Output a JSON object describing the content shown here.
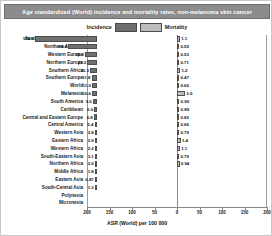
{
  "title": "Age standardized (World) incidence and mortality rates, non-melanoma skin cancer",
  "legend": {
    "incidence_label": "Incidence",
    "mortality_label": "Mortality",
    "incidence_color": "#6f6f6f",
    "mortality_color": "#bdbdbd"
  },
  "axis": {
    "xlabel": "ASR (World) per 100 000",
    "ticks": [
      "200",
      "150",
      "100",
      "50",
      "0",
      "50",
      "100",
      "150",
      "200"
    ]
  },
  "chart_data": {
    "type": "bar",
    "title": "Age standardized (World) incidence and mortality rates, non-melanoma skin cancer",
    "subtype": "diverging-horizontal-bar",
    "xlabel": "ASR (World) per 100 000",
    "ylabel": "",
    "xlim": [
      -200,
      200
    ],
    "xticks": [
      200,
      150,
      100,
      50,
      0,
      50,
      100,
      150,
      200
    ],
    "grid": false,
    "legend_position": "top-center",
    "categories": [
      "Australia and New Zealand",
      "Northern America",
      "Western Europe",
      "Northern Europe",
      "Southern Africa",
      "Southern Europe",
      "World",
      "Melanesia",
      "South America",
      "Caribbean",
      "Central and Eastern Europe",
      "Central America",
      "Western Asia",
      "Eastern Africa",
      "Western Africa",
      "South-Eastern Asia",
      "Northern Africa",
      "Middle Africa",
      "Eastern Asia",
      "South-Central Asia",
      "Polynesia",
      "Micronesia"
    ],
    "series": [
      {
        "name": "Incidence",
        "direction": "left",
        "color": "#6f6f6f",
        "values": [
          138.0,
          64.4,
          26.1,
          21.2,
          15.3,
          11.8,
          11.0,
          10.6,
          9.0,
          6.0,
          6.8,
          5.4,
          3.8,
          2.9,
          2.2,
          3.1,
          2.0,
          1.8,
          0.87,
          1.3,
          0.0,
          0.0
        ]
      },
      {
        "name": "Mortality",
        "direction": "right",
        "color": "#bdbdbd",
        "values": [
          1.1,
          0.59,
          0.53,
          0.71,
          1.2,
          0.47,
          0.6,
          3.0,
          0.9,
          0.89,
          0.82,
          0.66,
          0.79,
          1.4,
          1.1,
          0.79,
          0.94,
          0.0,
          0.0,
          0.0,
          0.0,
          0.0
        ]
      }
    ]
  },
  "rows": [
    {
      "label": "Australia and New Zealand",
      "incidence": "138.0",
      "mortality": "1.1",
      "inc_val": 138.0,
      "mor_val": 1.1
    },
    {
      "label": "Northern America",
      "incidence": "64.4",
      "mortality": "0.59",
      "inc_val": 64.4,
      "mor_val": 0.59
    },
    {
      "label": "Western Europe",
      "incidence": "26.1",
      "mortality": "0.53",
      "inc_val": 26.1,
      "mor_val": 0.53
    },
    {
      "label": "Northern Europe",
      "incidence": "21.2",
      "mortality": "0.71",
      "inc_val": 21.2,
      "mor_val": 0.71
    },
    {
      "label": "Southern Africa",
      "incidence": "15.3",
      "mortality": "1.2",
      "inc_val": 15.3,
      "mor_val": 1.2
    },
    {
      "label": "Southern Europe",
      "incidence": "11.8",
      "mortality": "0.47",
      "inc_val": 11.8,
      "mor_val": 0.47
    },
    {
      "label": "World",
      "incidence": "11.0",
      "mortality": "0.60",
      "inc_val": 11.0,
      "mor_val": 0.6
    },
    {
      "label": "Melanesia",
      "incidence": "10.6",
      "mortality": "3.0",
      "inc_val": 10.6,
      "mor_val": 3.0
    },
    {
      "label": "South America",
      "incidence": "9.0",
      "mortality": "0.90",
      "inc_val": 9.0,
      "mor_val": 0.9
    },
    {
      "label": "Caribbean",
      "incidence": "6.0",
      "mortality": "0.89",
      "inc_val": 6.0,
      "mor_val": 0.89
    },
    {
      "label": "Central and Eastern Europe",
      "incidence": "6.8",
      "mortality": "0.82",
      "inc_val": 6.8,
      "mor_val": 0.82
    },
    {
      "label": "Central America",
      "incidence": "5.4",
      "mortality": "0.66",
      "inc_val": 5.4,
      "mor_val": 0.66
    },
    {
      "label": "Western Asia",
      "incidence": "3.8",
      "mortality": "0.79",
      "inc_val": 3.8,
      "mor_val": 0.79
    },
    {
      "label": "Eastern Africa",
      "incidence": "2.9",
      "mortality": "1.4",
      "inc_val": 2.9,
      "mor_val": 1.4
    },
    {
      "label": "Western Africa",
      "incidence": "2.2",
      "mortality": "1.1",
      "inc_val": 2.2,
      "mor_val": 1.1
    },
    {
      "label": "South-Eastern Asia",
      "incidence": "3.1",
      "mortality": "0.79",
      "inc_val": 3.1,
      "mor_val": 0.79
    },
    {
      "label": "Northern Africa",
      "incidence": "2.0",
      "mortality": "0.94",
      "inc_val": 2.0,
      "mor_val": 0.94
    },
    {
      "label": "Middle Africa",
      "incidence": "1.8",
      "mortality": "",
      "inc_val": 1.8,
      "mor_val": 0
    },
    {
      "label": "Eastern Asia",
      "incidence": "0.87",
      "mortality": "",
      "inc_val": 0.87,
      "mor_val": 0
    },
    {
      "label": "South-Central Asia",
      "incidence": "1.3",
      "mortality": "",
      "inc_val": 1.3,
      "mor_val": 0
    },
    {
      "label": "Polynesia",
      "incidence": "",
      "mortality": "",
      "inc_val": 0,
      "mor_val": 0
    },
    {
      "label": "Micronesia",
      "incidence": "",
      "mortality": "",
      "inc_val": 0,
      "mor_val": 0
    }
  ]
}
